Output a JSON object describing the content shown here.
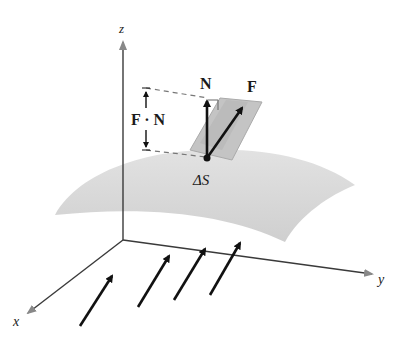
{
  "diagram": {
    "labels": {
      "z_axis": "z",
      "y_axis": "y",
      "x_axis": "x",
      "normal": "N",
      "field": "F",
      "dot_product": "F · N",
      "patch": "ΔS"
    },
    "colors": {
      "axis": "#3a3a3a",
      "surface": "#d6d6d6",
      "parallelepiped": "#bdbdbd",
      "vector": "#111111",
      "dashed": "#777777"
    },
    "field_arrows_count": 4
  }
}
